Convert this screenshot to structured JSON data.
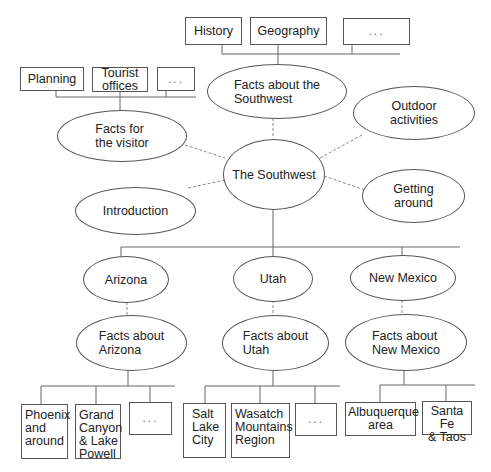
{
  "diagram": {
    "type": "site-structure-tree",
    "root": {
      "label": "The Southwest"
    },
    "top_level": {
      "facts_southwest": {
        "label": "Facts about the\nSouthwest"
      },
      "outdoor": {
        "label": "Outdoor\nactivities"
      },
      "getting_around": {
        "label": "Getting\naround"
      },
      "introduction": {
        "label": "Introduction"
      },
      "facts_visitor": {
        "label": "Facts for\nthe visitor"
      }
    },
    "southwest_children": [
      {
        "label": "History"
      },
      {
        "label": "Geography"
      },
      {
        "label": "..."
      }
    ],
    "visitor_children": [
      {
        "label": "Planning"
      },
      {
        "label": "Tourist\noffices"
      },
      {
        "label": "..."
      }
    ],
    "states": [
      {
        "label": "Arizona",
        "facts": "Facts about\nArizona",
        "children": [
          {
            "label": "Phoenix\nand\naround"
          },
          {
            "label": "Grand\nCanyon\n& Lake\nPowell"
          },
          {
            "label": "..."
          }
        ]
      },
      {
        "label": "Utah",
        "facts": "Facts about\nUtah",
        "children": [
          {
            "label": "Salt\nLake\nCity"
          },
          {
            "label": "Wasatch\nMountains\nRegion"
          },
          {
            "label": "..."
          }
        ]
      },
      {
        "label": "New Mexico",
        "facts": "Facts about\nNew Mexico",
        "children": [
          {
            "label": "Albuquerque\narea"
          },
          {
            "label": "Santa Fe\n& Taos"
          }
        ]
      }
    ]
  }
}
